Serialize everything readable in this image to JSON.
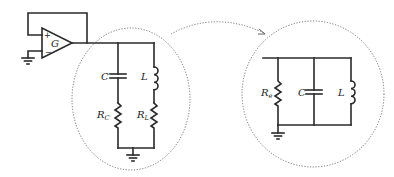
{
  "diagram": {
    "type": "circuit-schematic",
    "left_circuit": {
      "amplifier": {
        "label": "G",
        "plus": "+",
        "minus": "−"
      },
      "components": [
        {
          "id": "capacitor",
          "label": "C"
        },
        {
          "id": "inductor",
          "label": "L"
        },
        {
          "id": "resistor-c",
          "label": "R",
          "subscript": "C"
        },
        {
          "id": "resistor-l",
          "label": "R",
          "subscript": "L"
        }
      ]
    },
    "right_circuit": {
      "components": [
        {
          "id": "resistor-e",
          "label": "R",
          "subscript": "e"
        },
        {
          "id": "capacitor",
          "label": "C"
        },
        {
          "id": "inductor",
          "label": "L"
        }
      ]
    },
    "arrow": "dotted-curved-arrow",
    "colors": {
      "wire": "#2a2a2a",
      "dotted": "#666666",
      "background": "#ffffff"
    }
  }
}
